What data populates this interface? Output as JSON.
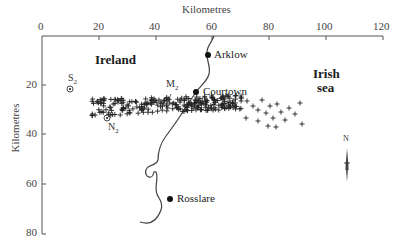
{
  "map": {
    "x_axis": {
      "title": "Kilometres",
      "ticks": [
        "0",
        "20",
        "40",
        "60",
        "80",
        "100",
        "120"
      ],
      "range": [
        0,
        120
      ]
    },
    "y_axis": {
      "title": "Kilometres",
      "ticks": [
        "20",
        "40",
        "60",
        "80"
      ],
      "range": [
        0,
        80
      ]
    },
    "regions": [
      {
        "name": "Ireland"
      },
      {
        "name_line1": "Irish",
        "name_line2": "sea"
      }
    ],
    "towns": [
      {
        "name": "Arklow",
        "x_km": 58.5,
        "y_km": 8
      },
      {
        "name": "Courtown",
        "x_km": 54.5,
        "y_km": 22.5
      },
      {
        "name": "Rosslare",
        "x_km": 45,
        "y_km": 66
      }
    ],
    "stations": [
      {
        "name": "S",
        "sub": "2",
        "x_km": 10,
        "y_km": 21.5
      },
      {
        "name": "N",
        "sub": "2",
        "x_km": 23,
        "y_km": 33
      },
      {
        "name": "M",
        "sub": "2",
        "x_km": 48,
        "y_km": 25
      }
    ],
    "north_arrow": {
      "label": "N"
    },
    "colors": {
      "line": "#333333",
      "marker": "#111111",
      "text": "#222222"
    }
  },
  "chart_data": {
    "type": "scatter",
    "title": "",
    "xlabel": "Kilometres",
    "ylabel": "Kilometres",
    "xlim": [
      0,
      120
    ],
    "ylim": [
      80,
      0
    ],
    "x_ticks": [
      0,
      20,
      40,
      60,
      80,
      100,
      120
    ],
    "y_ticks": [
      20,
      40,
      60,
      80
    ],
    "legend": "none",
    "grid": false,
    "series": [
      {
        "name": "observation points (+)",
        "description": "dense elongated cluster from ~x=18 to ~x=90 km, y ~26-38 km, densest between x=30-65 km"
      }
    ],
    "annotations": [
      "Ireland",
      "Irish sea",
      "Arklow",
      "Courtown",
      "Rosslare",
      "S2",
      "N2",
      "M2",
      "N"
    ]
  }
}
